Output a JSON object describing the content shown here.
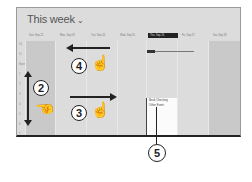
{
  "header": {
    "title": "This week",
    "chevron": "⌄"
  },
  "days": [
    {
      "label": "Sun, Sep 22",
      "weekend": true,
      "selected": false
    },
    {
      "label": "Mon, Sep 23",
      "weekend": false,
      "selected": false
    },
    {
      "label": "Tue, Sep 24",
      "weekend": false,
      "selected": false
    },
    {
      "label": "Wed, Sep 25",
      "weekend": false,
      "selected": false
    },
    {
      "label": "Thu, Sep 26",
      "weekend": false,
      "selected": true
    },
    {
      "label": "Fri, Sep 27",
      "weekend": false,
      "selected": false
    },
    {
      "label": "Sat, Sep 28",
      "weekend": true,
      "selected": false
    }
  ],
  "hours": [
    "10",
    "11",
    "Noon",
    "1",
    "2",
    "3",
    "4",
    "5",
    "6",
    "7"
  ],
  "appointment": {
    "line1": "Book Checking",
    "line2": "Other Event"
  },
  "callouts": {
    "c2": "2",
    "c3": "3",
    "c4": "4",
    "c5": "5"
  },
  "icons": {
    "hand": "☝",
    "up_down_arrow": "↕"
  },
  "colors": {
    "screen_bg": "#dcdcdc",
    "weekend_bg": "#c9c9c9",
    "selected_header": "#222222"
  }
}
